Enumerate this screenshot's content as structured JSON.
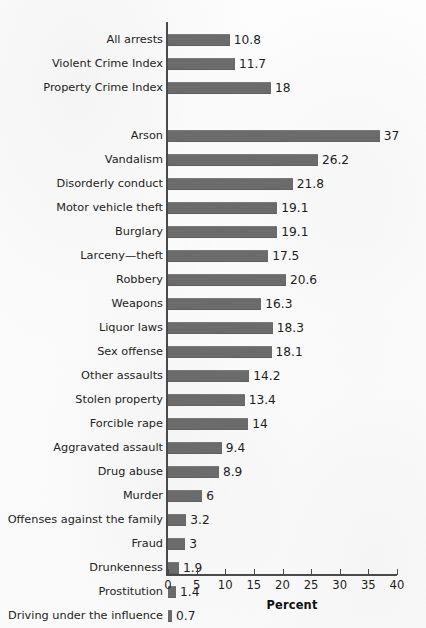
{
  "figure": {
    "background_color": "#fcfcfc",
    "bar_color": "#6b6b6b",
    "axis_color": "#4a4a4a"
  },
  "chart_data": {
    "type": "bar",
    "orientation": "horizontal",
    "title": "",
    "xlabel": "Percent",
    "ylabel": "",
    "xlim": [
      0,
      40
    ],
    "xticks": [
      0,
      5,
      10,
      15,
      20,
      25,
      30,
      35,
      40
    ],
    "xtick_labels": [
      "0",
      "5",
      "10",
      "15",
      "20",
      "25",
      "30",
      "35",
      "40"
    ],
    "grid": false,
    "legend": null,
    "categories": [
      "All arrests",
      "Violent Crime Index",
      "Property Crime Index",
      "Arson",
      "Vandalism",
      "Disorderly conduct",
      "Motor vehicle theft",
      "Burglary",
      "Larceny—theft",
      "Robbery",
      "Weapons",
      "Liquor laws",
      "Sex offense",
      "Other assaults",
      "Stolen property",
      "Forcible rape",
      "Aggravated assault",
      "Drug abuse",
      "Murder",
      "Offenses against the family",
      "Fraud",
      "Drunkenness",
      "Prostitution",
      "Driving under the influence"
    ],
    "values": [
      10.8,
      11.7,
      18,
      37,
      26.2,
      21.8,
      19.1,
      19.1,
      17.5,
      20.6,
      16.3,
      18.3,
      18.1,
      14.2,
      13.4,
      14,
      9.4,
      8.9,
      6,
      3.2,
      3,
      1.9,
      1.4,
      0.7
    ],
    "value_labels": [
      "10.8",
      "11.7",
      "18",
      "37",
      "26.2",
      "21.8",
      "19.1",
      "19.1",
      "17.5",
      "20.6",
      "16.3",
      "18.3",
      "18.1",
      "14.2",
      "13.4",
      "14",
      "9.4",
      "8.9",
      "6",
      "3.2",
      "3",
      "1.9",
      "1.4",
      "0.7"
    ],
    "group_break_after_index": 2
  }
}
